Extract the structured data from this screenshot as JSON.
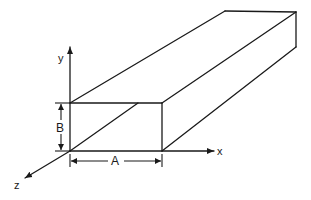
{
  "diagram": {
    "axes": {
      "x_label": "x",
      "y_label": "y",
      "z_label": "z"
    },
    "dimensions": {
      "width_label": "A",
      "height_label": "B"
    },
    "colors": {
      "stroke": "#1a1a1a",
      "background": "#ffffff"
    }
  }
}
